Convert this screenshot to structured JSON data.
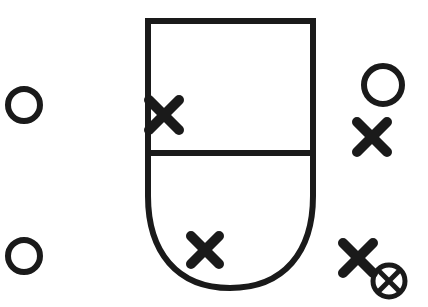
{
  "figure": {
    "background_color": "#ffffff",
    "ink_color": "#1a1a1a",
    "width": 428,
    "height": 307
  },
  "main_shape": {
    "name": "shield-outline",
    "description": "Rectangle with rounded U-shaped bottom, divided by a horizontal line",
    "stroke_color": "#1a1a1a",
    "stroke_width": 6,
    "fill": "none",
    "left_x": 148,
    "right_x": 313,
    "top_y": 21,
    "divider_y": 153,
    "bottom_y": 288,
    "path": "M 148 21 L 313 21 L 313 196 C 313 252 284 288 230 288 C 177 288 148 252 148 196 Z",
    "divider_path": "M 148 153 L 313 153"
  },
  "markers": {
    "open_circles": [
      {
        "label": "circle-left-upper",
        "cx": 24,
        "cy": 105,
        "r": 16,
        "stroke_width": 6
      },
      {
        "label": "circle-left-lower",
        "cx": 24,
        "cy": 256,
        "r": 16,
        "stroke_width": 6
      },
      {
        "label": "circle-right-upper",
        "cx": 383,
        "cy": 85,
        "r": 19,
        "stroke_width": 6
      }
    ],
    "crosses": [
      {
        "label": "cross-on-left-edge",
        "cx": 164,
        "cy": 115,
        "size": 15,
        "arm_width": 9
      },
      {
        "label": "cross-on-bottom-curve",
        "cx": 205,
        "cy": 250,
        "size": 14,
        "arm_width": 9
      },
      {
        "label": "cross-right-middle",
        "cx": 372,
        "cy": 137,
        "size": 15,
        "arm_width": 9
      },
      {
        "label": "cross-right-lower",
        "cx": 358,
        "cy": 258,
        "size": 15,
        "arm_width": 9
      }
    ],
    "circled_cross": {
      "label": "circled-cross-bottom-right",
      "cx": 389,
      "cy": 281,
      "r": 16,
      "stroke_width": 5,
      "cross_size": 9,
      "cross_arm_width": 5
    }
  }
}
